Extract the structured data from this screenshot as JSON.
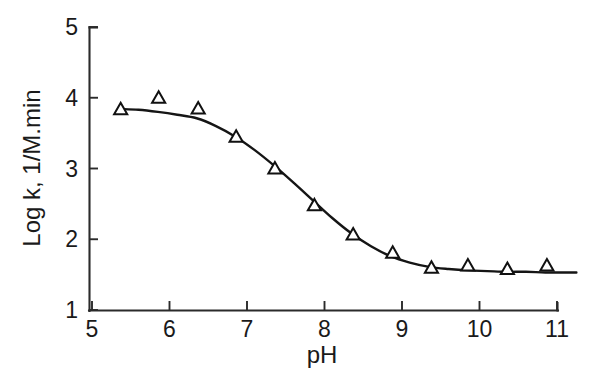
{
  "figure": {
    "background": "#ffffff",
    "width": 605,
    "height": 390
  },
  "chart_data": {
    "type": "scatter",
    "title": "",
    "subtitle": "",
    "xlabel": "pH",
    "ylabel": "Log k, 1/M.min",
    "xlim": [
      5,
      11.3
    ],
    "ylim": [
      1,
      5
    ],
    "xticks": [
      5,
      6,
      7,
      8,
      9,
      10,
      11
    ],
    "xtick_labels": [
      "5",
      "6",
      "7",
      "8",
      "9",
      "10",
      "11"
    ],
    "yticks": [
      1,
      2,
      3,
      4,
      5
    ],
    "ytick_labels": [
      "1",
      "2",
      "3",
      "4",
      "5"
    ],
    "grid": false,
    "legend": null,
    "annotations": [],
    "marker_shape": "triangle-open",
    "marker_color": "#111111",
    "line_color": "#151515",
    "series": [
      {
        "name": "observed",
        "representation": "markers",
        "x": [
          5.37,
          5.86,
          6.37,
          6.86,
          7.36,
          7.87,
          8.37,
          8.88,
          9.38,
          9.85,
          10.36,
          10.87
        ],
        "y": [
          3.84,
          4.0,
          3.85,
          3.45,
          3.0,
          2.48,
          2.07,
          1.81,
          1.6,
          1.63,
          1.58,
          1.63
        ]
      },
      {
        "name": "fitted curve",
        "representation": "line",
        "x": [
          5.37,
          5.6,
          5.85,
          6.1,
          6.35,
          6.6,
          6.85,
          7.1,
          7.35,
          7.6,
          7.85,
          8.1,
          8.35,
          8.6,
          8.85,
          9.1,
          9.35,
          9.6,
          9.85,
          10.1,
          10.35,
          10.6,
          10.85,
          11.1,
          11.25
        ],
        "y": [
          3.84,
          3.83,
          3.8,
          3.76,
          3.71,
          3.6,
          3.45,
          3.26,
          3.04,
          2.8,
          2.55,
          2.3,
          2.08,
          1.9,
          1.76,
          1.67,
          1.61,
          1.58,
          1.56,
          1.55,
          1.54,
          1.54,
          1.53,
          1.53,
          1.53
        ]
      }
    ]
  }
}
